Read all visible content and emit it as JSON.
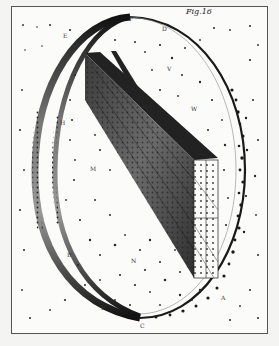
{
  "plate": {
    "caption": "Fig.16",
    "subject": "Engraving of a star-filled elliptical ring (galactic stratum) with a prism-shaped slab of stars crossing it",
    "labels": [
      {
        "text": "F",
        "x": 129,
        "y": 16
      },
      {
        "text": "D",
        "x": 162,
        "y": 26
      },
      {
        "text": "E",
        "x": 63,
        "y": 33
      },
      {
        "text": "V",
        "x": 167,
        "y": 66
      },
      {
        "text": "W",
        "x": 191,
        "y": 106
      },
      {
        "text": "H",
        "x": 60,
        "y": 120
      },
      {
        "text": "M",
        "x": 90,
        "y": 166
      },
      {
        "text": "B",
        "x": 67,
        "y": 252
      },
      {
        "text": "N",
        "x": 131,
        "y": 258
      },
      {
        "text": "A",
        "x": 221,
        "y": 295
      },
      {
        "text": "P",
        "x": 101,
        "y": 305
      },
      {
        "text": "C",
        "x": 140,
        "y": 323
      }
    ]
  },
  "colors": {
    "paper": "#fbfbfa",
    "ink": "#1a1a1a",
    "border": "#555555"
  }
}
